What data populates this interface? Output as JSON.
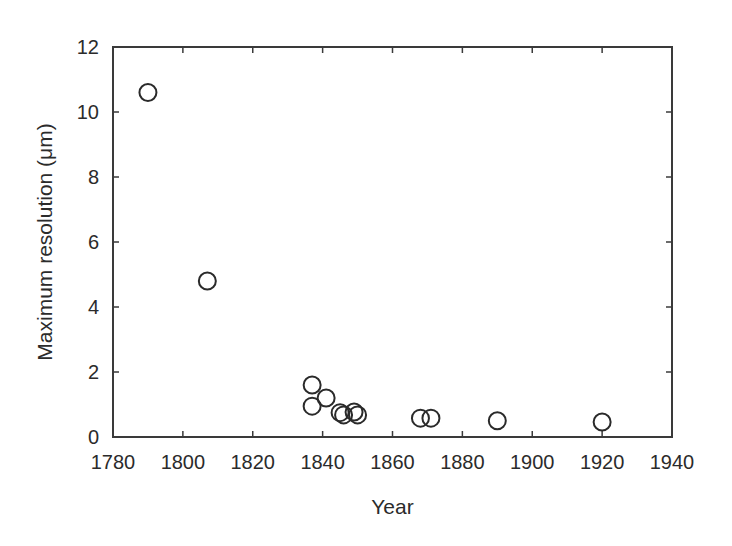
{
  "chart_data": {
    "type": "scatter",
    "title": "",
    "xlabel": "Year",
    "ylabel": "Maximum resolution (μm)",
    "xlim": [
      1780,
      1940
    ],
    "ylim": [
      0,
      12
    ],
    "xticks": [
      1780,
      1800,
      1820,
      1840,
      1860,
      1880,
      1900,
      1920,
      1940
    ],
    "yticks": [
      0,
      2,
      4,
      6,
      8,
      10,
      12
    ],
    "grid": false,
    "legend": null,
    "marker": "open-circle",
    "colors": {
      "marker_stroke": "#2a2a2a",
      "frame": "#3a3a3a",
      "text": "#2b2b2b",
      "background": "#ffffff"
    },
    "series": [
      {
        "name": "Maximum resolution",
        "points": [
          {
            "x": 1790,
            "y": 10.6
          },
          {
            "x": 1807,
            "y": 4.8
          },
          {
            "x": 1837,
            "y": 1.6
          },
          {
            "x": 1837,
            "y": 0.95
          },
          {
            "x": 1841,
            "y": 1.2
          },
          {
            "x": 1845,
            "y": 0.75
          },
          {
            "x": 1846,
            "y": 0.68
          },
          {
            "x": 1849,
            "y": 0.77
          },
          {
            "x": 1850,
            "y": 0.68
          },
          {
            "x": 1868,
            "y": 0.58
          },
          {
            "x": 1871,
            "y": 0.58
          },
          {
            "x": 1890,
            "y": 0.5
          },
          {
            "x": 1920,
            "y": 0.46
          }
        ]
      }
    ]
  }
}
